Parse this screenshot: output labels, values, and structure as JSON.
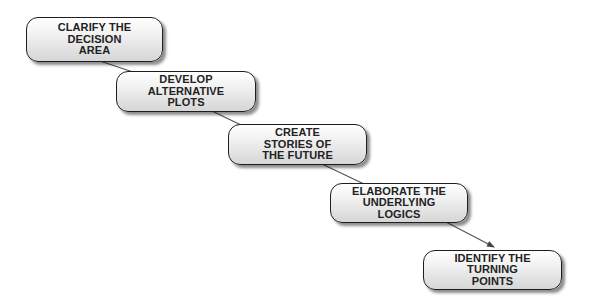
{
  "diagram": {
    "type": "flow",
    "direction": "diagonal-down-right",
    "steps": [
      {
        "id": "step1",
        "label": "CLARIFY THE\nDECISION\nAREA",
        "box": {
          "x": 26,
          "y": 17,
          "w": 137,
          "h": 45
        }
      },
      {
        "id": "step2",
        "label": "DEVELOP\nALTERNATIVE\nPLOTS",
        "box": {
          "x": 116,
          "y": 71,
          "w": 140,
          "h": 41
        }
      },
      {
        "id": "step3",
        "label": "CREATE\nSTORIES OF\nTHE FUTURE",
        "box": {
          "x": 228,
          "y": 124,
          "w": 139,
          "h": 41
        }
      },
      {
        "id": "step4",
        "label": "ELABORATE THE\nUNDERLYING\nLOGICS",
        "box": {
          "x": 330,
          "y": 183,
          "w": 138,
          "h": 40
        }
      },
      {
        "id": "step5",
        "label": "IDENTIFY THE\nTURNING\nPOINTS",
        "box": {
          "x": 423,
          "y": 250,
          "w": 139,
          "h": 40
        }
      }
    ],
    "connectors": [
      {
        "from": "step1",
        "to": "step2",
        "arrow": false
      },
      {
        "from": "step2",
        "to": "step3",
        "arrow": false
      },
      {
        "from": "step3",
        "to": "step4",
        "arrow": false
      },
      {
        "from": "step4",
        "to": "step5",
        "arrow": true
      }
    ],
    "colors": {
      "outline": "#1e1e1e",
      "connector": "#555555",
      "fill_top": "#ffffff",
      "fill_bottom": "#d6d6d6",
      "text": "#222222"
    }
  }
}
